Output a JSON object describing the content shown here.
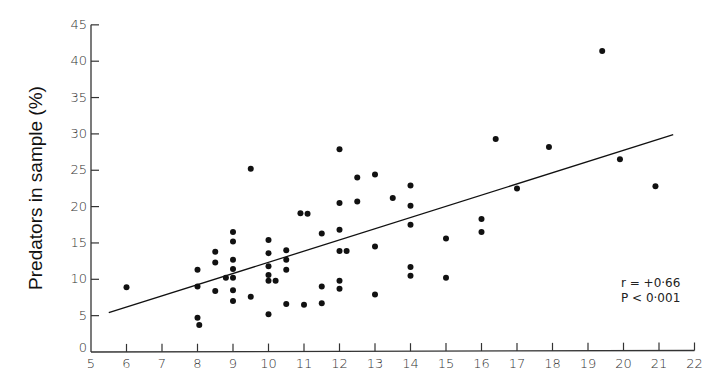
{
  "chart_data": {
    "type": "scatter",
    "title": "",
    "xlabel": "",
    "ylabel": "Predators in sample (%)",
    "xlim": [
      5,
      22
    ],
    "ylim": [
      0,
      45
    ],
    "xticks": [
      5,
      6,
      7,
      8,
      9,
      10,
      11,
      12,
      13,
      14,
      15,
      16,
      17,
      18,
      19,
      20,
      21,
      22
    ],
    "yticks": [
      0,
      5,
      10,
      15,
      20,
      25,
      30,
      35,
      40,
      45
    ],
    "grid": false,
    "legend": null,
    "annotations": [
      "r = +0·66",
      "P < 0·001"
    ],
    "regression_line": {
      "x1": 5.5,
      "y1": 5.4,
      "x2": 21.4,
      "y2": 29.9
    },
    "points": [
      {
        "x": 6,
        "y": 8.9
      },
      {
        "x": 8,
        "y": 11.3
      },
      {
        "x": 8,
        "y": 9.0
      },
      {
        "x": 8,
        "y": 4.7
      },
      {
        "x": 8.05,
        "y": 3.7
      },
      {
        "x": 8.5,
        "y": 13.8
      },
      {
        "x": 8.5,
        "y": 12.3
      },
      {
        "x": 8.5,
        "y": 8.4
      },
      {
        "x": 8.8,
        "y": 10.2
      },
      {
        "x": 9,
        "y": 16.5
      },
      {
        "x": 9,
        "y": 15.2
      },
      {
        "x": 9,
        "y": 12.7
      },
      {
        "x": 9,
        "y": 11.4
      },
      {
        "x": 9,
        "y": 10.2
      },
      {
        "x": 9,
        "y": 8.5
      },
      {
        "x": 9,
        "y": 7.0
      },
      {
        "x": 9.5,
        "y": 25.2
      },
      {
        "x": 9.5,
        "y": 7.6
      },
      {
        "x": 10,
        "y": 15.4
      },
      {
        "x": 10,
        "y": 13.6
      },
      {
        "x": 10,
        "y": 11.8
      },
      {
        "x": 10,
        "y": 10.6
      },
      {
        "x": 10,
        "y": 9.8
      },
      {
        "x": 10,
        "y": 5.2
      },
      {
        "x": 10.2,
        "y": 9.8
      },
      {
        "x": 10.5,
        "y": 14.0
      },
      {
        "x": 10.5,
        "y": 12.7
      },
      {
        "x": 10.5,
        "y": 11.3
      },
      {
        "x": 10.5,
        "y": 6.6
      },
      {
        "x": 10.9,
        "y": 19.1
      },
      {
        "x": 11.0,
        "y": 6.5
      },
      {
        "x": 11.1,
        "y": 19.0
      },
      {
        "x": 11.5,
        "y": 16.3
      },
      {
        "x": 11.5,
        "y": 9.0
      },
      {
        "x": 11.5,
        "y": 6.7
      },
      {
        "x": 12,
        "y": 27.9
      },
      {
        "x": 12,
        "y": 20.5
      },
      {
        "x": 12,
        "y": 16.8
      },
      {
        "x": 12,
        "y": 13.9
      },
      {
        "x": 12,
        "y": 9.8
      },
      {
        "x": 12,
        "y": 8.7
      },
      {
        "x": 12.2,
        "y": 13.9
      },
      {
        "x": 12.5,
        "y": 24.0
      },
      {
        "x": 12.5,
        "y": 20.7
      },
      {
        "x": 13,
        "y": 24.4
      },
      {
        "x": 13,
        "y": 14.5
      },
      {
        "x": 13,
        "y": 7.9
      },
      {
        "x": 13.5,
        "y": 21.2
      },
      {
        "x": 14,
        "y": 22.9
      },
      {
        "x": 14,
        "y": 20.1
      },
      {
        "x": 14,
        "y": 17.5
      },
      {
        "x": 14,
        "y": 11.7
      },
      {
        "x": 14,
        "y": 10.5
      },
      {
        "x": 15,
        "y": 15.6
      },
      {
        "x": 15,
        "y": 10.2
      },
      {
        "x": 16,
        "y": 18.3
      },
      {
        "x": 16,
        "y": 16.5
      },
      {
        "x": 16.4,
        "y": 29.3
      },
      {
        "x": 17.0,
        "y": 22.5
      },
      {
        "x": 17.9,
        "y": 28.2
      },
      {
        "x": 19.4,
        "y": 41.4
      },
      {
        "x": 19.9,
        "y": 26.5
      },
      {
        "x": 20.9,
        "y": 22.8
      }
    ]
  },
  "colors": {
    "ink": "#111111",
    "axis": "#333333",
    "background": "#ffffff"
  }
}
